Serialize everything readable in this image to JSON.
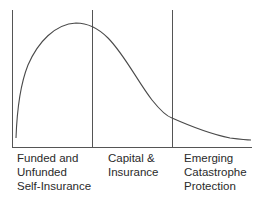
{
  "diagram": {
    "type": "risk-financing-segments-curve",
    "colors": {
      "line": "#555555",
      "curve": "#4a4a4a",
      "text": "#2a2a2a",
      "background": "#ffffff"
    },
    "segments": [
      {
        "id": "self-insurance",
        "label": "Funded and\nUnfunded\nSelf-Insurance"
      },
      {
        "id": "capital-insurance",
        "label": "Capital &\nInsurance"
      },
      {
        "id": "catastrophe",
        "label": "Emerging\nCatastrophe\nProtection"
      }
    ],
    "dividers": [
      {
        "name": "left-axis",
        "x": 12
      },
      {
        "name": "divider-1",
        "x": 92
      },
      {
        "name": "divider-2",
        "x": 172
      }
    ],
    "curve": {
      "description": "skewed bell curve rising steeply from left, peaking in first segment, with long tail to the right",
      "peak_segment": "self-insurance"
    }
  }
}
